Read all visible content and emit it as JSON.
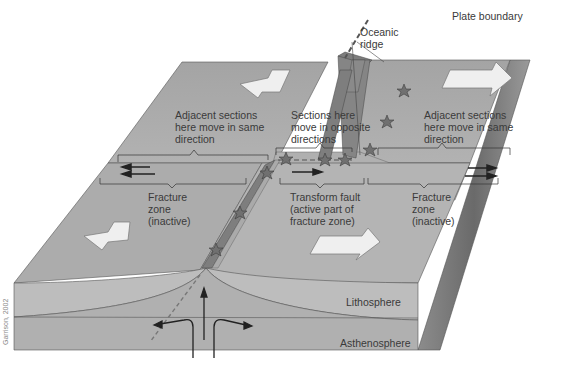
{
  "figure": {
    "title_labels": {
      "plate_boundary": "Plate boundary",
      "oceanic_ridge": "Oceanic\nridge"
    },
    "zones": {
      "top_left": "Adjacent sections\nhere move in same\ndirection",
      "top_middle": "Sections here\nmove in opposite\ndirections",
      "top_right": "Adjacent sections\nhere move in same\ndirection",
      "bottom_left": "Fracture\nzone\n(inactive)",
      "bottom_middle": "Transform fault\n(active part of\nfracture zone)",
      "bottom_right": "Fracture\nzone\n(inactive)"
    },
    "layers": {
      "lithosphere": "Lithosphere",
      "asthenosphere": "Asthenosphere"
    },
    "credit": "Garrison, 2002",
    "colors": {
      "plate_top": "#a9a9a9",
      "plate_side_front": "#bcbcbc",
      "asthenosphere": "#b0b0b0",
      "ridge": "#7a7a7a",
      "arrow_fill": "#efefef",
      "text": "#3a3a3a",
      "star": "#6e6e6e"
    },
    "markers": {
      "earthquake_star_count": 9,
      "motion_arrows": "white block arrows (left plate moves left, right plate moves right)"
    }
  }
}
